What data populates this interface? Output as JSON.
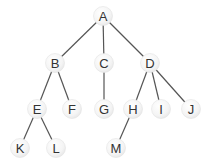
{
  "diagram": {
    "type": "tree",
    "colors": {
      "edge": "#555555",
      "node_fill": "#f3f3f3",
      "label": "#333333"
    },
    "nodes": [
      {
        "id": "A",
        "label": "A",
        "x": 103,
        "y": 16
      },
      {
        "id": "B",
        "label": "B",
        "x": 55,
        "y": 63
      },
      {
        "id": "C",
        "label": "C",
        "x": 104,
        "y": 63
      },
      {
        "id": "D",
        "label": "D",
        "x": 150,
        "y": 63
      },
      {
        "id": "E",
        "label": "E",
        "x": 37,
        "y": 109
      },
      {
        "id": "F",
        "label": "F",
        "x": 72,
        "y": 109
      },
      {
        "id": "G",
        "label": "G",
        "x": 104,
        "y": 109
      },
      {
        "id": "H",
        "label": "H",
        "x": 133,
        "y": 109
      },
      {
        "id": "I",
        "label": "I",
        "x": 161,
        "y": 109
      },
      {
        "id": "J",
        "label": "J",
        "x": 191,
        "y": 109
      },
      {
        "id": "K",
        "label": "K",
        "x": 20,
        "y": 148
      },
      {
        "id": "L",
        "label": "L",
        "x": 56,
        "y": 148
      },
      {
        "id": "M",
        "label": "M",
        "x": 116,
        "y": 148
      }
    ],
    "edges": [
      [
        "A",
        "B"
      ],
      [
        "A",
        "C"
      ],
      [
        "A",
        "D"
      ],
      [
        "B",
        "E"
      ],
      [
        "B",
        "F"
      ],
      [
        "C",
        "G"
      ],
      [
        "D",
        "H"
      ],
      [
        "D",
        "I"
      ],
      [
        "D",
        "J"
      ],
      [
        "E",
        "K"
      ],
      [
        "E",
        "L"
      ],
      [
        "H",
        "M"
      ]
    ]
  }
}
